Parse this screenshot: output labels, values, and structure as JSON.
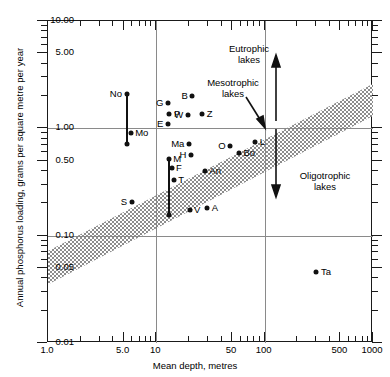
{
  "chart_data": {
    "type": "scatter",
    "title": "",
    "xlabel": "Mean depth, metres",
    "ylabel": "Annual phosphorus loading, grams per square metre per year",
    "xscale": "log",
    "yscale": "log",
    "xlim": [
      1.0,
      1000
    ],
    "ylim": [
      0.01,
      10.0
    ],
    "grid": "major-only",
    "xticks": [
      {
        "value": 1.0,
        "label": "1.0"
      },
      {
        "value": 5.0,
        "label": "5.0"
      },
      {
        "value": 10,
        "label": "10"
      },
      {
        "value": 50,
        "label": "50"
      },
      {
        "value": 100,
        "label": "100"
      },
      {
        "value": 500,
        "label": "500"
      },
      {
        "value": 1000,
        "label": "1000"
      }
    ],
    "yticks": [
      {
        "value": 10.0,
        "label": "10.00"
      },
      {
        "value": 5.0,
        "label": "5.00"
      },
      {
        "value": 1.0,
        "label": "1.00"
      },
      {
        "value": 0.5,
        "label": "0.50"
      },
      {
        "value": 0.1,
        "label": "0.10"
      },
      {
        "value": 0.05,
        "label": "0.05"
      },
      {
        "value": 0.01,
        "label": "0.01"
      }
    ],
    "gridlines_x": [
      10,
      100
    ],
    "gridlines_y": [
      1.0,
      0.1
    ],
    "points": [
      {
        "label": "No",
        "x": 5.3,
        "y": 2.1,
        "label_side": "left"
      },
      {
        "label": "Mo",
        "x": 5.8,
        "y": 0.9,
        "label_side": "right"
      },
      {
        "label": "G",
        "x": 12.8,
        "y": 1.74,
        "label_side": "left"
      },
      {
        "label": "B",
        "x": 21.5,
        "y": 2.0,
        "label_side": "left"
      },
      {
        "label": "P",
        "x": 13.2,
        "y": 1.37,
        "label_side": "right"
      },
      {
        "label": "W",
        "x": 19.5,
        "y": 1.33,
        "label_side": "left"
      },
      {
        "label": "Z",
        "x": 26.5,
        "y": 1.37,
        "label_side": "right"
      },
      {
        "label": "E",
        "x": 12.8,
        "y": 1.1,
        "label_side": "left"
      },
      {
        "label": "Ma",
        "x": 20.0,
        "y": 0.72,
        "label_side": "left"
      },
      {
        "label": "H",
        "x": 20.8,
        "y": 0.56,
        "label_side": "left"
      },
      {
        "label": "O",
        "x": 48.0,
        "y": 0.68,
        "label_side": "left"
      },
      {
        "label": "L",
        "x": 82.0,
        "y": 0.74,
        "label_side": "right"
      },
      {
        "label": "Bo",
        "x": 58.0,
        "y": 0.59,
        "label_side": "right"
      },
      {
        "label": "M",
        "x": 13.0,
        "y": 0.52,
        "label_side": "right"
      },
      {
        "label": "F",
        "x": 13.8,
        "y": 0.43,
        "label_side": "right"
      },
      {
        "label": "T",
        "x": 14.5,
        "y": 0.33,
        "label_side": "right"
      },
      {
        "label": "An",
        "x": 28.0,
        "y": 0.4,
        "label_side": "right"
      },
      {
        "label": "S",
        "x": 5.9,
        "y": 0.205,
        "label_side": "left"
      },
      {
        "label": "V",
        "x": 20.3,
        "y": 0.175,
        "label_side": "right"
      },
      {
        "label": "A",
        "x": 29.5,
        "y": 0.18,
        "label_side": "right"
      },
      {
        "label": "Ta",
        "x": 300,
        "y": 0.046,
        "label_side": "right"
      }
    ],
    "error_bars": [
      {
        "label": "No-Mo",
        "x": 5.4,
        "y_top": 2.1,
        "y_bottom": 0.72
      },
      {
        "label": "M-T",
        "x": 13.0,
        "y_top": 0.52,
        "y_bottom": 0.157
      }
    ],
    "band": {
      "name": "mesotrophic-band",
      "description": "Stippled diagonal band separating eutrophic (above) from oligotrophic (below) lakes",
      "upper_left": {
        "x": 1.0,
        "y": 0.072
      },
      "upper_right": {
        "x": 1000,
        "y": 2.6
      },
      "lower_left": {
        "x": 1.0,
        "y": 0.035
      },
      "lower_right": {
        "x": 1000,
        "y": 1.3
      },
      "fill": "#9a9a9a"
    },
    "annotations": [
      {
        "name": "eutrophic",
        "text_line1": "Eutrophic",
        "text_line2": "lakes",
        "x": 130,
        "y": 4.6
      },
      {
        "name": "mesotrophic",
        "text_line1": "Mesotrophic",
        "text_line2": "lakes",
        "x": 115,
        "y": 2.0
      },
      {
        "name": "oligotrophic",
        "text_line1": "Oligotrophic",
        "text_line2": "lakes",
        "x": 300,
        "y": 0.33
      }
    ],
    "arrows": [
      {
        "name": "eutrophic-arrow",
        "direction": "up"
      },
      {
        "name": "oligotrophic-arrow",
        "direction": "down"
      },
      {
        "name": "mesotrophic-pointer",
        "direction": "down-right"
      }
    ]
  }
}
